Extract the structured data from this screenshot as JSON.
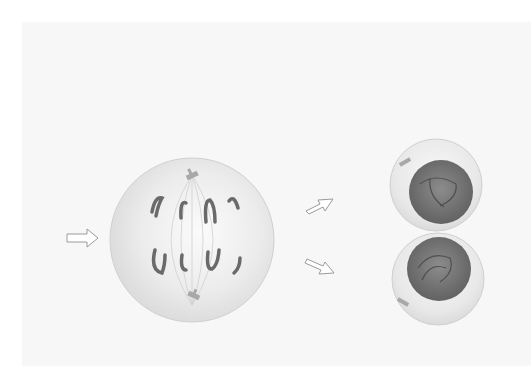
{
  "diagram": {
    "type": "cell-division",
    "stages": [
      {
        "name": "anaphase-cell",
        "chromosomes_top": 4,
        "chromosomes_bottom": 4,
        "centrosomes": 2
      },
      {
        "name": "daughter-cells",
        "count": 2,
        "nuclei": 2
      }
    ],
    "arrows": [
      {
        "name": "input-arrow",
        "direction": "right"
      },
      {
        "name": "arrow-to-top-daughter",
        "direction": "up-right"
      },
      {
        "name": "arrow-to-bottom-daughter",
        "direction": "down-right"
      }
    ],
    "colors": {
      "background": "#ffffff",
      "panel": "#f7f7f7",
      "cytoplasm": "#e6e6e6",
      "cytoplasm_highlight": "#fafafa",
      "chromosome": "#6a6a6a",
      "nucleus": "#7a7a7a",
      "centrosome": "#a8a8a8",
      "arrow_stroke": "#9a9a9a"
    }
  }
}
